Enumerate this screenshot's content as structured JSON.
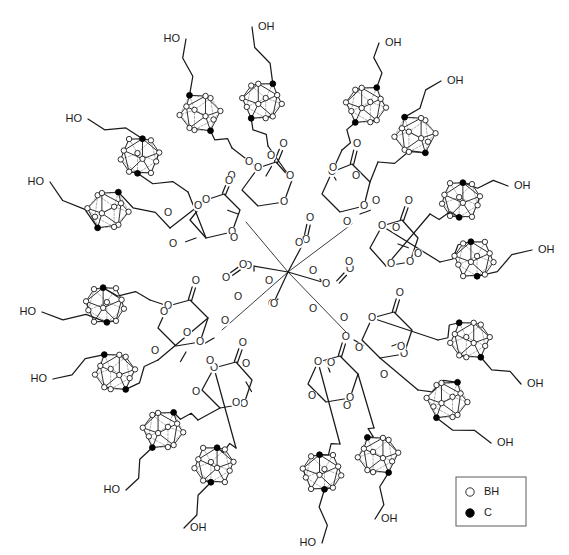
{
  "figure": {
    "background_color": "#ffffff",
    "line_color": "#1a1a1a",
    "width": 569,
    "height": 555
  },
  "legend": {
    "name": "vertex-legend",
    "box": {
      "x": 456,
      "y": 477,
      "width": 70,
      "height": 49
    },
    "entries": [
      {
        "symbol": "open-circle",
        "label": "BH",
        "fill": "#ffffff",
        "stroke": "#1a1a1a"
      },
      {
        "symbol": "filled-circle",
        "label": "C",
        "fill": "#000000",
        "stroke": "#000000"
      }
    ]
  },
  "core": {
    "type": "pentaerythritol",
    "label": "C",
    "x": 288,
    "y": 272,
    "arms": 4
  },
  "branch_unit": {
    "type": "bis-MPA",
    "description": "2,2-bis(hydroxymethyl)propionic acid",
    "methyl_label": "CH3"
  },
  "atom_labels": {
    "oxygen": "O",
    "hydroxyl_left": "HO",
    "hydroxyl_right": "OH"
  },
  "cage": {
    "type": "icosahedral-carborane",
    "vertex_count": 12,
    "carbon_vertices": 2,
    "bh_vertices": 10,
    "radius": 21
  },
  "counts": {
    "carborane_cages": 16,
    "hydroxyl_groups": 16,
    "dendrimer_generation": 2
  },
  "hydroxyls": [
    {
      "id": "oh-01",
      "text": "HO",
      "x": 180,
      "y": 39,
      "anchor": "end"
    },
    {
      "id": "oh-02",
      "text": "OH",
      "x": 258,
      "y": 27,
      "anchor": "start"
    },
    {
      "id": "oh-03",
      "text": "HO",
      "x": 82,
      "y": 119,
      "anchor": "end"
    },
    {
      "id": "oh-04",
      "text": "HO",
      "x": 44,
      "y": 182,
      "anchor": "end"
    },
    {
      "id": "oh-05",
      "text": "OH",
      "x": 385,
      "y": 43,
      "anchor": "start"
    },
    {
      "id": "oh-06",
      "text": "OH",
      "x": 447,
      "y": 81,
      "anchor": "start"
    },
    {
      "id": "oh-07",
      "text": "OH",
      "x": 514,
      "y": 186,
      "anchor": "start"
    },
    {
      "id": "oh-08",
      "text": "OH",
      "x": 538,
      "y": 250,
      "anchor": "start"
    },
    {
      "id": "oh-09",
      "text": "HO",
      "x": 36,
      "y": 312,
      "anchor": "end"
    },
    {
      "id": "oh-10",
      "text": "HO",
      "x": 47,
      "y": 379,
      "anchor": "end"
    },
    {
      "id": "oh-11",
      "text": "HO",
      "x": 120,
      "y": 490,
      "anchor": "end"
    },
    {
      "id": "oh-12",
      "text": "OH",
      "x": 190,
      "y": 528,
      "anchor": "start"
    },
    {
      "id": "oh-13",
      "text": "HO",
      "x": 316,
      "y": 543,
      "anchor": "end"
    },
    {
      "id": "oh-14",
      "text": "OH",
      "x": 381,
      "y": 519,
      "anchor": "start"
    },
    {
      "id": "oh-15",
      "text": "OH",
      "x": 497,
      "y": 443,
      "anchor": "start"
    },
    {
      "id": "oh-16",
      "text": "OH",
      "x": 527,
      "y": 384,
      "anchor": "start"
    }
  ],
  "cages": [
    {
      "id": "cage-01",
      "x": 200,
      "y": 113,
      "rot": 18
    },
    {
      "id": "cage-02",
      "x": 262,
      "y": 101,
      "rot": -12
    },
    {
      "id": "cage-03",
      "x": 140,
      "y": 156,
      "rot": 8
    },
    {
      "id": "cage-04",
      "x": 108,
      "y": 210,
      "rot": -20
    },
    {
      "id": "cage-05",
      "x": 366,
      "y": 105,
      "rot": -14
    },
    {
      "id": "cage-06",
      "x": 415,
      "y": 135,
      "rot": 20
    },
    {
      "id": "cage-07",
      "x": 461,
      "y": 200,
      "rot": 6
    },
    {
      "id": "cage-08",
      "x": 474,
      "y": 259,
      "rot": -10
    },
    {
      "id": "cage-09",
      "x": 105,
      "y": 305,
      "rot": -6
    },
    {
      "id": "cage-10",
      "x": 115,
      "y": 372,
      "rot": 14
    },
    {
      "id": "cage-11",
      "x": 163,
      "y": 430,
      "rot": -16
    },
    {
      "id": "cage-12",
      "x": 214,
      "y": 465,
      "rot": 10
    },
    {
      "id": "cage-13",
      "x": 322,
      "y": 472,
      "rot": -8
    },
    {
      "id": "cage-14",
      "x": 378,
      "y": 455,
      "rot": 16
    },
    {
      "id": "cage-15",
      "x": 447,
      "y": 400,
      "rot": -18
    },
    {
      "id": "cage-16",
      "x": 470,
      "y": 340,
      "rot": 12
    }
  ],
  "oxygen_atoms": [
    {
      "x": 249,
      "y": 162
    },
    {
      "x": 271,
      "y": 156
    },
    {
      "x": 229,
      "y": 181
    },
    {
      "x": 290,
      "y": 176
    },
    {
      "x": 198,
      "y": 206
    },
    {
      "x": 168,
      "y": 213
    },
    {
      "x": 234,
      "y": 238
    },
    {
      "x": 173,
      "y": 244
    },
    {
      "x": 243,
      "y": 265
    },
    {
      "x": 299,
      "y": 243
    },
    {
      "x": 269,
      "y": 281
    },
    {
      "x": 313,
      "y": 271
    },
    {
      "x": 333,
      "y": 168
    },
    {
      "x": 356,
      "y": 176
    },
    {
      "x": 376,
      "y": 201
    },
    {
      "x": 396,
      "y": 228
    },
    {
      "x": 347,
      "y": 222
    },
    {
      "x": 418,
      "y": 254
    },
    {
      "x": 349,
      "y": 262
    },
    {
      "x": 391,
      "y": 264
    },
    {
      "x": 164,
      "y": 312
    },
    {
      "x": 187,
      "y": 333
    },
    {
      "x": 155,
      "y": 351
    },
    {
      "x": 225,
      "y": 321
    },
    {
      "x": 238,
      "y": 297
    },
    {
      "x": 274,
      "y": 304
    },
    {
      "x": 210,
      "y": 361
    },
    {
      "x": 246,
      "y": 364
    },
    {
      "x": 196,
      "y": 392
    },
    {
      "x": 236,
      "y": 403
    },
    {
      "x": 313,
      "y": 309
    },
    {
      "x": 344,
      "y": 318
    },
    {
      "x": 359,
      "y": 348
    },
    {
      "x": 331,
      "y": 363
    },
    {
      "x": 384,
      "y": 375
    },
    {
      "x": 401,
      "y": 347
    },
    {
      "x": 312,
      "y": 396
    },
    {
      "x": 347,
      "y": 406
    }
  ]
}
